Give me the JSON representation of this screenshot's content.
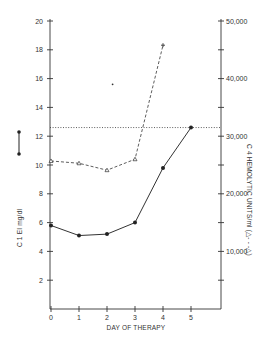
{
  "chart_data": {
    "type": "line",
    "title": "",
    "xlabel": "DAY OF THERAPY",
    "ylabel_left": "C 1 EI mg/dl",
    "ylabel_right": "C 4 HEMOLYTIC UNITS/ml",
    "legend_left": "●——●",
    "legend_right": "△- - -△",
    "x": [
      0,
      1,
      2,
      3,
      4,
      5
    ],
    "x_ticks": [
      "0",
      "1",
      "2",
      "3",
      "4",
      "5"
    ],
    "y_left_ticks": [
      "2",
      "4",
      "6",
      "8",
      "10",
      "12",
      "14",
      "16",
      "18",
      "20"
    ],
    "y_left_range": [
      0,
      20
    ],
    "y_right_ticks": [
      "10,000",
      "20,000",
      "30,000",
      "40,000",
      "50,000"
    ],
    "y_right_range": [
      0,
      50000
    ],
    "grid": false,
    "series": [
      {
        "name": "C 1 EI mg/dl",
        "axis": "left",
        "style": "solid",
        "marker": "filled-circle",
        "x": [
          0,
          1,
          2,
          3,
          4,
          5
        ],
        "values": [
          5.8,
          5.1,
          5.2,
          6.0,
          9.8,
          12.6
        ]
      },
      {
        "name": "C 4 hemolytic units/ml",
        "axis": "right",
        "style": "dashed",
        "marker": "open-triangle",
        "x": [
          0,
          1,
          2,
          3,
          4
        ],
        "values": [
          25700,
          25300,
          24100,
          26000,
          45800
        ]
      }
    ],
    "annotations": [
      {
        "type": "horizontal-dotted-line",
        "axis": "left",
        "value": 12.6
      },
      {
        "type": "point",
        "axis": "left",
        "x": 2.2,
        "value": 15.6
      }
    ]
  }
}
